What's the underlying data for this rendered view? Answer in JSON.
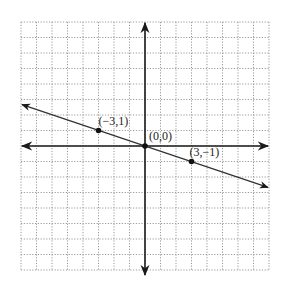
{
  "chart_data": {
    "type": "line",
    "title": "",
    "xlabel": "",
    "ylabel": "",
    "xlim": [
      -8,
      8
    ],
    "ylim": [
      -8,
      8
    ],
    "grid": true,
    "grid_style": "dotted",
    "equation": "y = -x/3",
    "series": [
      {
        "name": "line",
        "x": [
          -8,
          8
        ],
        "y": [
          2.667,
          -2.667
        ],
        "arrows_both_ends": true
      }
    ],
    "points": [
      {
        "x": -3,
        "y": 1,
        "label": "(−3,1)"
      },
      {
        "x": 0,
        "y": 0,
        "label": "(0,0)"
      },
      {
        "x": 3,
        "y": -1,
        "label": "(3,−1)"
      }
    ]
  },
  "colors": {
    "grid": "#9a9a9a",
    "axis": "#1a1a1a",
    "line": "#333333",
    "point": "#111111"
  }
}
